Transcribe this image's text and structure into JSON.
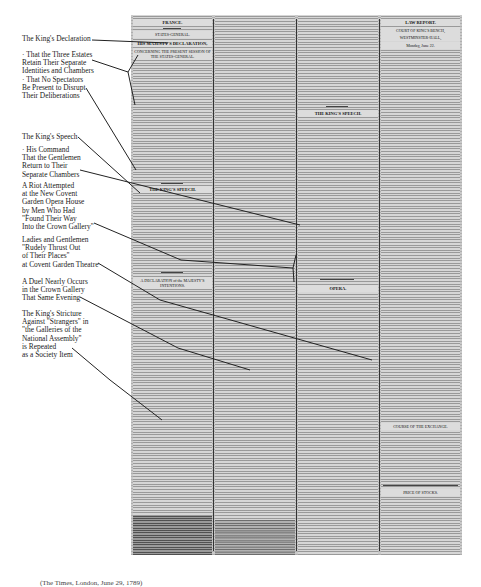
{
  "annotations": [
    {
      "id": "kings-declaration",
      "text": "The King's Declaration",
      "top": 35
    },
    {
      "id": "three-estates",
      "text": "· That the Three Estates\nRetain Their Separate\nIdentities and Chambers",
      "top": 52
    },
    {
      "id": "no-spectators",
      "text": "· That No Spectators\nBe Present to Disrupt\nTheir Deliberations",
      "top": 76
    },
    {
      "id": "kings-speech",
      "text": "The King's Speech",
      "top": 133
    },
    {
      "id": "his-command",
      "text": "· His Command\nThat the Gentlemen\nReturn to Their\nSeparate Chambers",
      "top": 146
    },
    {
      "id": "riot-attempted",
      "text": "A Riot Attempted\nat the New Covent\nGarden Opera House\nby Men Who Had\n\"Found Their Way\nInto the Crown Gallery\"",
      "top": 182
    },
    {
      "id": "ladies-gentlemen",
      "text": "Ladies and Gentlemen\n\"Rudely Thrust Out\nof Their Places\"\nat Covent Garden Theatre",
      "top": 236
    },
    {
      "id": "duel",
      "text": "A Duel Nearly Occurs\nin the Crown Gallery\nThat Same Evening",
      "top": 278
    },
    {
      "id": "kings-stricture",
      "text": "The King's Stricture\nAgainst \"Strangers\" in\n\"the Galleries of the\nNational Assembly\"\nis Repeated\nas a Society Item",
      "top": 310
    }
  ],
  "newspaper": {
    "col1": {
      "section": "FRANCE.",
      "subsection": "STATES-GENERAL.",
      "headline": "HIS MAJESTY'S DECLARATION,",
      "subhead": "CONCERNING THE PRESENT SESSION OF THE STATES-GENERAL.",
      "speech_title": "THE KING'S SPEECH.",
      "second_title": "A DECLARATION of the MAJESTY'S INTENTIONS."
    },
    "col2": {
      "first_article": "Art. XIII."
    },
    "col3": {
      "first_article": "Art. XXXIV.",
      "speech_title": "THE KING'S SPEECH.",
      "opera_title": "OPERA."
    },
    "col4": {
      "section": "LAW REPORT.",
      "court": "COURT OF KING'S BENCH,",
      "place": "WESTMINSTER-HALL,",
      "date": "Monday, June 22.",
      "table_title": "COURSE OF THE EXCHANGE.",
      "prices_title": "PRICE OF STOCKS."
    }
  },
  "footer_caption": "(The Times, London, June 29, 1789)"
}
